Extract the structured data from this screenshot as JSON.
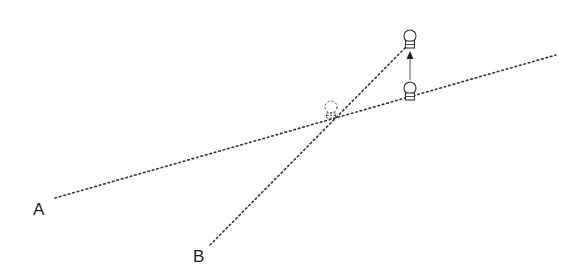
{
  "diagram": {
    "labels": {
      "a": "A",
      "b": "B"
    },
    "colors": {
      "stroke": "#333333",
      "background": "#ffffff"
    },
    "elements": [
      {
        "name": "line-a",
        "type": "dotted-line",
        "from": [
          55,
          198
        ],
        "to": [
          556,
          55
        ]
      },
      {
        "name": "line-b",
        "type": "dotted-line",
        "from": [
          210,
          245
        ],
        "to": [
          405,
          47
        ]
      },
      {
        "name": "bulb-top",
        "type": "bulb",
        "style": "solid",
        "center": [
          410,
          37
        ]
      },
      {
        "name": "bulb-bottom",
        "type": "bulb",
        "style": "solid",
        "center": [
          410,
          88
        ]
      },
      {
        "name": "bulb-ghost",
        "type": "bulb",
        "style": "dashed",
        "center": [
          331,
          107
        ]
      },
      {
        "name": "move-arrow",
        "type": "arrow",
        "from": [
          410,
          80
        ],
        "to": [
          410,
          52
        ]
      }
    ]
  }
}
